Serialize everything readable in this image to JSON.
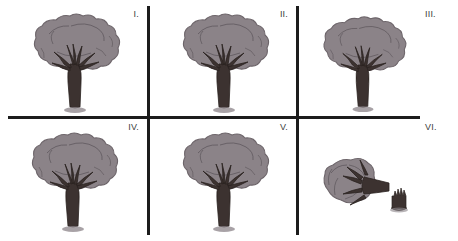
{
  "figure": {
    "width": 458,
    "height": 241,
    "background_color": "#ffffff",
    "rule_color": "#1c1c1c",
    "label_color": "#3d3d3d"
  },
  "palette": {
    "canopy_fill": "#8b8388",
    "canopy_outline": "#6d656a",
    "canopy_detail": "#625b60",
    "trunk_fill": "#3c3230",
    "trunk_outline": "#2a2220",
    "ground_shadow": "#8b8388"
  },
  "grid": {
    "columns": 3,
    "rows": 2,
    "h_rule": {
      "x": 8,
      "y": 116,
      "width": 412,
      "height": 3
    },
    "v_rules": [
      {
        "x": 147,
        "y": 6,
        "width": 3,
        "height": 229
      },
      {
        "x": 296,
        "y": 6,
        "width": 3,
        "height": 229
      }
    ]
  },
  "panels": [
    {
      "id": "panel-1",
      "label": "I.",
      "subject": "upright-tree",
      "description": "Full leafy tree with broad canopy and branching trunk"
    },
    {
      "id": "panel-2",
      "label": "II.",
      "subject": "upright-tree",
      "description": "Full leafy tree with broad canopy and branching trunk"
    },
    {
      "id": "panel-3",
      "label": "III.",
      "subject": "upright-tree",
      "description": "Full leafy tree with broad canopy and branching trunk"
    },
    {
      "id": "panel-4",
      "label": "IV.",
      "subject": "upright-tree",
      "description": "Full leafy tree with broad canopy and branching trunk"
    },
    {
      "id": "panel-5",
      "label": "V.",
      "subject": "upright-tree",
      "description": "Full leafy tree with broad canopy and branching trunk"
    },
    {
      "id": "panel-6",
      "label": "VI.",
      "subject": "felled-tree",
      "description": "Toppled tree lying on its side beside a splintered stump"
    }
  ]
}
